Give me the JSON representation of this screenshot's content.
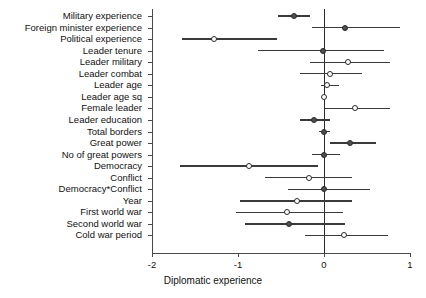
{
  "chart_data": {
    "type": "scatter",
    "title": "",
    "xlabel": "Diplomatic experience",
    "ylabel": "",
    "xlim": [
      -2.35,
      1.2
    ],
    "xticks": [
      -2,
      -1,
      0,
      1
    ],
    "xticklabels": [
      "-2",
      "-1",
      "0",
      "1"
    ],
    "grid": false,
    "reference_line": 0,
    "legend": "none",
    "categories": [
      "Military experience",
      "Foreign minister experience",
      "Political experience",
      "Leader tenure",
      "Leader military",
      "Leader combat",
      "Leader age",
      "Leader age sq",
      "Female leader",
      "Leader education",
      "Total borders",
      "Great power",
      "No of great powers",
      "Democracy",
      "Conflict",
      "Democracy*Conflict",
      "Year",
      "First world war",
      "Second world war",
      "Cold war period"
    ],
    "values": [
      -0.35,
      0.24,
      -1.28,
      -0.01,
      0.28,
      0.07,
      0.04,
      0.0,
      0.36,
      -0.12,
      0.0,
      0.3,
      0.0,
      -0.87,
      -0.17,
      0.0,
      -0.31,
      -0.43,
      -0.41,
      0.23
    ],
    "ci_lower": [
      -0.54,
      -0.14,
      -1.65,
      -0.77,
      -0.16,
      -0.28,
      -0.03,
      -0.01,
      0.01,
      -0.28,
      -0.06,
      0.07,
      -0.14,
      -1.68,
      -0.69,
      -0.42,
      -0.98,
      -1.02,
      -0.92,
      -0.22
    ],
    "ci_upper": [
      -0.16,
      0.88,
      -0.55,
      0.7,
      0.77,
      0.44,
      0.18,
      0.01,
      0.77,
      0.07,
      0.07,
      0.6,
      0.19,
      -0.07,
      0.33,
      0.54,
      0.33,
      0.22,
      0.24,
      0.74
    ],
    "filled": [
      true,
      true,
      false,
      true,
      false,
      false,
      false,
      false,
      false,
      true,
      true,
      true,
      true,
      false,
      false,
      true,
      false,
      false,
      true,
      false
    ]
  }
}
